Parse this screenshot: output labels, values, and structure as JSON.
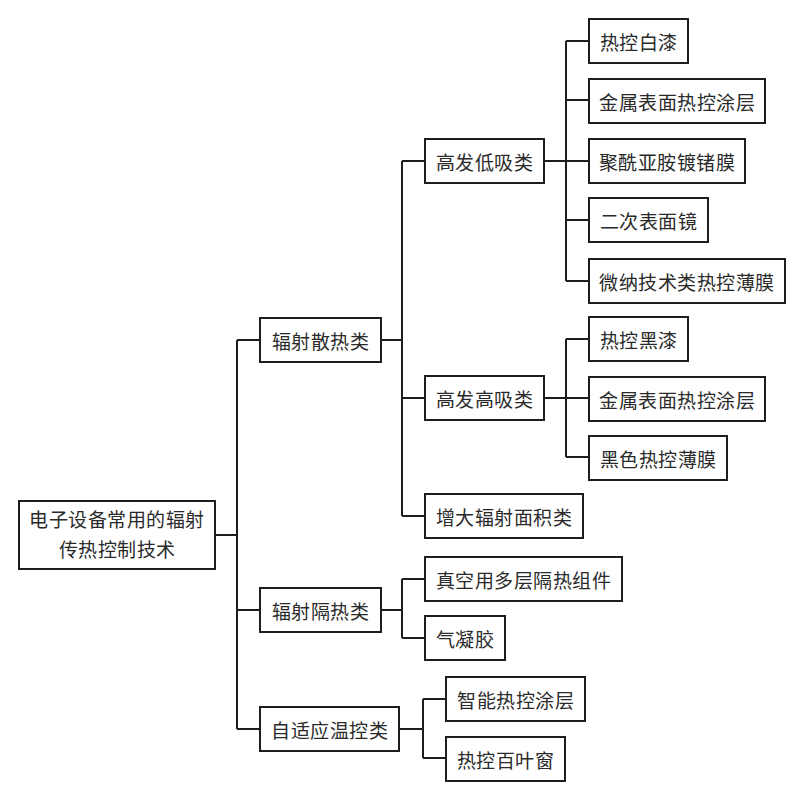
{
  "root": {
    "line1": "电子设备常用的辐射",
    "line2": "传热控制技术"
  },
  "level1": [
    {
      "label": "辐射散热类"
    },
    {
      "label": "辐射隔热类"
    },
    {
      "label": "自适应温控类"
    }
  ],
  "radiative_dissipation": {
    "children": [
      {
        "label": "高发低吸类"
      },
      {
        "label": "高发高吸类"
      },
      {
        "label": "增大辐射面积类"
      }
    ]
  },
  "high_emit_low_absorb": {
    "items": [
      {
        "label": "热控白漆"
      },
      {
        "label": "金属表面热控涂层"
      },
      {
        "label": "聚酰亚胺镀锗膜"
      },
      {
        "label": "二次表面镜"
      },
      {
        "label": "微纳技术类热控薄膜"
      }
    ]
  },
  "high_emit_high_absorb": {
    "items": [
      {
        "label": "热控黑漆"
      },
      {
        "label": "金属表面热控涂层"
      },
      {
        "label": "黑色热控薄膜"
      }
    ]
  },
  "radiative_insulation": {
    "items": [
      {
        "label": "真空用多层隔热组件"
      },
      {
        "label": "气凝胶"
      }
    ]
  },
  "adaptive_thermal_control": {
    "items": [
      {
        "label": "智能热控涂层"
      },
      {
        "label": "热控百叶窗"
      }
    ]
  }
}
